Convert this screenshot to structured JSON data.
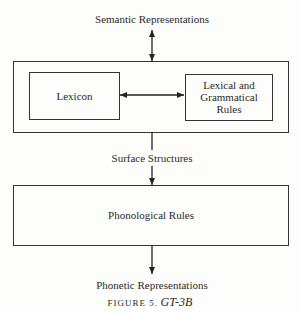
{
  "diagram": {
    "top_label": "Semantic Representations",
    "grammar_box": {
      "lexicon": "Lexicon",
      "rules_line1": "Lexical and",
      "rules_line2": "Grammatical",
      "rules_line3": "Rules"
    },
    "middle_label": "Surface Structures",
    "phonology_box": "Phonological Rules",
    "bottom_label": "Phonetic Representations",
    "caption": {
      "prefix": "FIGURE 5.",
      "title": "GT-3B"
    },
    "edges": [
      {
        "from": "Semantic Representations",
        "to": "grammar_box",
        "type": "bidirectional"
      },
      {
        "from": "Lexicon",
        "to": "Lexical and Grammatical Rules",
        "type": "bidirectional"
      },
      {
        "from": "grammar_box",
        "to": "Phonological Rules",
        "label": "Surface Structures",
        "type": "directed"
      },
      {
        "from": "Phonological Rules",
        "to": "Phonetic Representations",
        "type": "directed"
      }
    ]
  }
}
